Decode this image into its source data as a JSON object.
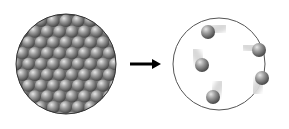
{
  "diagram": {
    "left_panel": {
      "label": "solid",
      "particle_count_visible": "hexagonal close-packed array"
    },
    "arrow": {
      "direction": "right"
    },
    "right_panel": {
      "label": "gas",
      "particles": [
        {
          "x": 208,
          "y": 32
        },
        {
          "x": 259,
          "y": 50
        },
        {
          "x": 202,
          "y": 65
        },
        {
          "x": 262,
          "y": 78
        },
        {
          "x": 213,
          "y": 97
        }
      ]
    },
    "colors": {
      "particle": "#8a8a8a",
      "outline": "#444444",
      "background": "#ffffff"
    }
  }
}
